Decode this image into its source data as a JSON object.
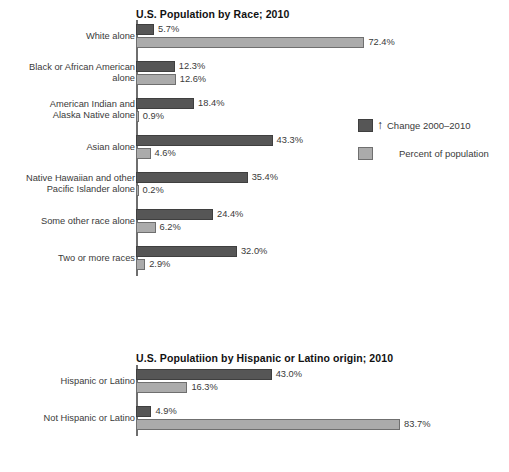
{
  "legend": {
    "arrow_glyph": "↑",
    "items": [
      {
        "label": "Change 2000–2010",
        "key": "change",
        "color": "#565656",
        "has_arrow": true
      },
      {
        "label": "Percent of population",
        "key": "percent",
        "color": "#ababab",
        "has_arrow": false
      }
    ]
  },
  "chart_data": [
    {
      "type": "bar",
      "orientation": "horizontal",
      "id": "race",
      "title": "U.S. Population by Race; 2010",
      "xlabel": "",
      "ylabel": "",
      "xlim": [
        0,
        83.7
      ],
      "grid": false,
      "legend_position": "right",
      "categories": [
        "White alone",
        "Black or African American alone",
        "American Indian and Alaska Native alone",
        "Asian alone",
        "Native Hawaiian and other Pacific Islander alone",
        "Some other race alone",
        "Two or more races"
      ],
      "category_lines": [
        [
          "White alone"
        ],
        [
          "Black or African American",
          "alone"
        ],
        [
          "American Indian and",
          "Alaska Native alone"
        ],
        [
          "Asian alone"
        ],
        [
          "Native Hawaiian and other",
          "Pacific Islander alone"
        ],
        [
          "Some other race alone"
        ],
        [
          "Two or more races"
        ]
      ],
      "series": [
        {
          "name": "Change 2000–2010",
          "key": "change",
          "color": "#565656",
          "values": [
            5.7,
            12.3,
            18.4,
            43.3,
            35.4,
            24.4,
            32.0
          ],
          "labels": [
            "5.7%",
            "12.3%",
            "18.4%",
            "43.3%",
            "35.4%",
            "24.4%",
            "32.0%"
          ]
        },
        {
          "name": "Percent of population",
          "key": "percent",
          "color": "#ababab",
          "values": [
            72.4,
            12.6,
            0.9,
            4.6,
            0.2,
            6.2,
            2.9
          ],
          "labels": [
            "72.4%",
            "12.6%",
            "0.9%",
            "4.6%",
            "0.2%",
            "6.2%",
            "2.9%"
          ]
        }
      ]
    },
    {
      "type": "bar",
      "orientation": "horizontal",
      "id": "hispanic",
      "title": "U.S. Populatiion by Hispanic or Latino origin; 2010",
      "xlabel": "",
      "ylabel": "",
      "xlim": [
        0,
        83.7
      ],
      "grid": false,
      "legend_position": "none",
      "categories": [
        "Hispanic or Latino",
        "Not Hispanic or Latino"
      ],
      "category_lines": [
        [
          "Hispanic or Latino"
        ],
        [
          "Not Hispanic or Latino"
        ]
      ],
      "series": [
        {
          "name": "Change 2000–2010",
          "key": "change",
          "color": "#565656",
          "values": [
            43.0,
            4.9
          ],
          "labels": [
            "43.0%",
            "4.9%"
          ]
        },
        {
          "name": "Percent of population",
          "key": "percent",
          "color": "#ababab",
          "values": [
            16.3,
            83.7
          ],
          "labels": [
            "16.3%",
            "83.7%"
          ]
        }
      ]
    }
  ]
}
